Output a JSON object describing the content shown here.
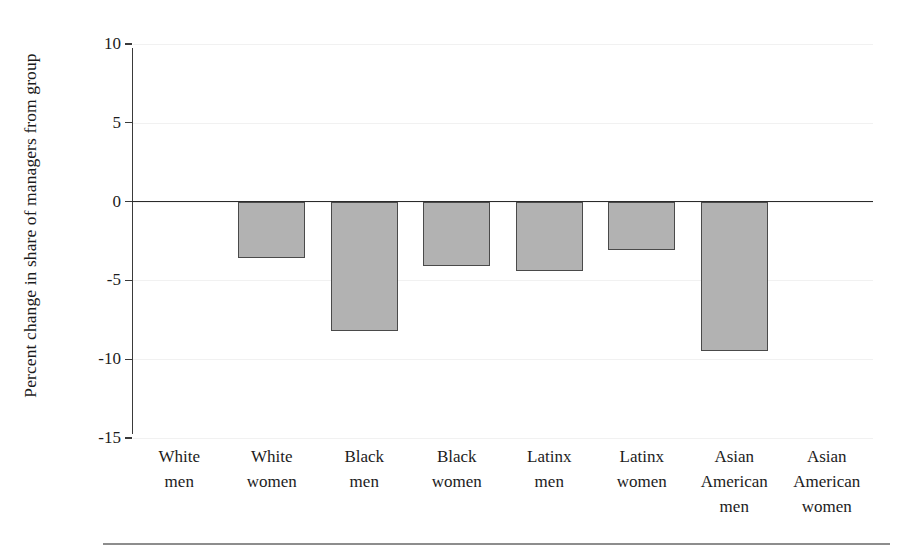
{
  "chart_data": {
    "type": "bar",
    "title": "",
    "subtitle": "",
    "xlabel": "",
    "ylabel": "Percent change in share of managers from group",
    "categories": [
      "White men",
      "White women",
      "Black men",
      "Black women",
      "Latinx men",
      "Latinx women",
      "Asian American men",
      "Asian American women"
    ],
    "category_lines": [
      [
        "White",
        "men"
      ],
      [
        "White",
        "women"
      ],
      [
        "Black",
        "men"
      ],
      [
        "Black",
        "women"
      ],
      [
        "Latinx",
        "men"
      ],
      [
        "Latinx",
        "women"
      ],
      [
        "Asian",
        "American",
        "men"
      ],
      [
        "Asian",
        "American",
        "women"
      ]
    ],
    "values": [
      0,
      -3.6,
      -8.2,
      -4.1,
      -4.4,
      -3.1,
      -9.5,
      0
    ],
    "ylim": [
      -15,
      10
    ],
    "yticks": [
      10,
      5,
      0,
      -5,
      -10,
      -15
    ],
    "ytick_labels": [
      "10",
      "5",
      "0",
      "-5",
      "-10",
      "-15"
    ],
    "grid": true,
    "grid_axis": "y",
    "legend": "none",
    "bar_fill_color": "#b2b2b2",
    "bar_edge_color": "#4a4a4a",
    "zero_line_color": "#2b2b2b",
    "gridline_color": "#f1f1f1",
    "background_color": "#ffffff"
  }
}
